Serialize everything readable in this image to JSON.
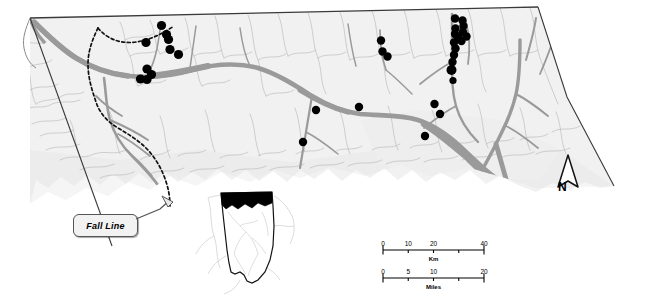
{
  "figure": {
    "type": "distribution-map",
    "region_name": "Northern Alabama",
    "background_color": "#ffffff",
    "land_fill": "#f0f0f0",
    "boundary_color": "#333333",
    "river_color": "#9a9a9a",
    "tributary_color": "#b5b5b5",
    "point_color": "#000000"
  },
  "annotations": {
    "fall_line": {
      "label": "Fall Line",
      "style": "italic-bold-callout"
    }
  },
  "north_arrow": {
    "label": "N",
    "icon": "north-arrow-icon"
  },
  "scale_bars": [
    {
      "name": "km-scale-bar",
      "unit_label": "Km",
      "labels": [
        "0",
        "10",
        "20",
        "40"
      ],
      "label_positions": [
        0,
        0.25,
        0.5,
        1.0
      ],
      "tick_positions": [
        0,
        0.25,
        0.5,
        0.75,
        1.0
      ],
      "max_value": 40
    },
    {
      "name": "miles-scale-bar",
      "unit_label": "Miles",
      "labels": [
        "0",
        "5",
        "10",
        "20"
      ],
      "label_positions": [
        0,
        0.25,
        0.5,
        1.0
      ],
      "tick_positions": [
        0,
        0.25,
        0.5,
        0.75,
        1.0
      ],
      "max_value": 20
    }
  ],
  "inset_map": {
    "name": "alabama-locator-inset",
    "state": "Alabama",
    "highlight_fill": "#000000",
    "highlight_description": "northern-strip-study-area",
    "outline_color": "#111111"
  },
  "chart_data": {
    "type": "scatter",
    "title": "",
    "xlabel": "",
    "ylabel": "",
    "symbol": "filled-circle",
    "symbol_color": "#000000",
    "point_count": 34,
    "points": [
      {
        "x": 161.5,
        "y": 25.5,
        "r": 4.6
      },
      {
        "x": 166.5,
        "y": 34.5,
        "r": 4.6
      },
      {
        "x": 168.5,
        "y": 39.5,
        "r": 4.6
      },
      {
        "x": 170.0,
        "y": 49.5,
        "r": 4.6
      },
      {
        "x": 146.0,
        "y": 42.5,
        "r": 4.6
      },
      {
        "x": 178.5,
        "y": 54.5,
        "r": 4.6
      },
      {
        "x": 147.0,
        "y": 69.0,
        "r": 4.6
      },
      {
        "x": 151.5,
        "y": 74.5,
        "r": 4.6
      },
      {
        "x": 140.5,
        "y": 79.0,
        "r": 4.6
      },
      {
        "x": 147.0,
        "y": 79.5,
        "r": 4.6
      },
      {
        "x": 381.0,
        "y": 40.5,
        "r": 4.2
      },
      {
        "x": 382.5,
        "y": 51.5,
        "r": 4.2
      },
      {
        "x": 387.5,
        "y": 56.5,
        "r": 4.2
      },
      {
        "x": 455.0,
        "y": 18.5,
        "r": 4.2
      },
      {
        "x": 462.5,
        "y": 20.5,
        "r": 4.2
      },
      {
        "x": 463.5,
        "y": 26.0,
        "r": 4.2
      },
      {
        "x": 455.5,
        "y": 28.5,
        "r": 4.2
      },
      {
        "x": 463.0,
        "y": 32.0,
        "r": 4.2
      },
      {
        "x": 455.0,
        "y": 34.0,
        "r": 4.2
      },
      {
        "x": 466.5,
        "y": 36.5,
        "r": 4.2
      },
      {
        "x": 458.0,
        "y": 37.5,
        "r": 4.2
      },
      {
        "x": 461.5,
        "y": 41.0,
        "r": 4.2
      },
      {
        "x": 454.0,
        "y": 42.5,
        "r": 4.2
      },
      {
        "x": 455.5,
        "y": 48.5,
        "r": 4.2
      },
      {
        "x": 454.0,
        "y": 55.0,
        "r": 4.2
      },
      {
        "x": 452.5,
        "y": 62.0,
        "r": 4.2
      },
      {
        "x": 451.5,
        "y": 70.0,
        "r": 5.0
      },
      {
        "x": 453.0,
        "y": 80.5,
        "r": 3.6
      },
      {
        "x": 316.0,
        "y": 110.0,
        "r": 4.2
      },
      {
        "x": 359.0,
        "y": 107.0,
        "r": 4.2
      },
      {
        "x": 303.0,
        "y": 142.0,
        "r": 4.2
      },
      {
        "x": 434.5,
        "y": 104.0,
        "r": 4.2
      },
      {
        "x": 440.0,
        "y": 114.0,
        "r": 4.2
      },
      {
        "x": 425.0,
        "y": 136.0,
        "r": 4.2
      }
    ],
    "axis_ranges": {
      "x": [
        0,
        647
      ],
      "y": [
        0,
        301
      ]
    },
    "grid": false,
    "legend": "none"
  }
}
